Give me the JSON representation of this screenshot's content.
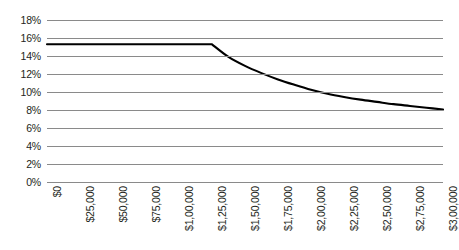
{
  "chart_data": {
    "type": "line",
    "title": "",
    "subtitle": "",
    "xlabel": "",
    "ylabel": "",
    "grid": true,
    "legend": false,
    "legend_position": "none",
    "line_color": "#000000",
    "gridline_color": "#8a8a8a",
    "background_color": "#ffffff",
    "xlim": [
      0,
      300000
    ],
    "ylim": [
      0,
      0.18
    ],
    "x_tick_labels": [
      "$0",
      "$25,000",
      "$50,000",
      "$75,000",
      "$1,00,000",
      "$1,25,000",
      "$1,50,000",
      "$1,75,000",
      "$2,00,000",
      "$2,25,000",
      "$2,50,000",
      "$2,75,000",
      "$3,00,000"
    ],
    "x_tick_values": [
      0,
      25000,
      50000,
      75000,
      100000,
      125000,
      150000,
      175000,
      200000,
      225000,
      250000,
      275000,
      300000
    ],
    "y_tick_labels": [
      "0%",
      "2%",
      "4%",
      "6%",
      "8%",
      "10%",
      "12%",
      "14%",
      "16%",
      "18%"
    ],
    "y_tick_values": [
      0,
      2,
      4,
      6,
      8,
      10,
      12,
      14,
      16,
      18
    ],
    "series": [
      {
        "name": "Effective rate",
        "x": [
          0,
          25000,
          50000,
          75000,
          100000,
          125000,
          137500,
          150000,
          162500,
          175000,
          187500,
          200000,
          212500,
          225000,
          237500,
          250000,
          262500,
          275000,
          287500,
          300000
        ],
        "values": [
          15.3,
          15.3,
          15.3,
          15.3,
          15.3,
          15.3,
          13.9,
          12.9,
          12.1,
          11.4,
          10.8,
          10.25,
          9.8,
          9.45,
          9.15,
          8.9,
          8.65,
          8.45,
          8.25,
          8.05
        ]
      }
    ],
    "annotations": [
      {
        "label": "breakpoint",
        "x": 125000,
        "y": 15.3
      }
    ]
  }
}
